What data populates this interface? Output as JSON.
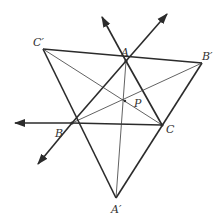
{
  "diagram": {
    "type": "geometry-figure",
    "colors": {
      "stroke": "#2b2b2b",
      "label": "#333333",
      "background": "#ffffff"
    },
    "points": {
      "A": {
        "x": 126,
        "y": 61,
        "label": "A"
      },
      "B": {
        "x": 72,
        "y": 123,
        "label": "B"
      },
      "C": {
        "x": 162,
        "y": 125,
        "label": "C"
      },
      "A_prime": {
        "x": 116,
        "y": 198,
        "label": "A'"
      },
      "B_prime": {
        "x": 202,
        "y": 63,
        "label": "B'"
      },
      "C_prime": {
        "x": 43,
        "y": 49,
        "label": "C'"
      },
      "P": {
        "x": 125,
        "y": 101,
        "label": "P"
      }
    },
    "labels": {
      "A": "A",
      "B": "B",
      "C": "C",
      "A_prime": "A′",
      "B_prime": "B′",
      "C_prime": "C′",
      "P": "P"
    },
    "thick_segments": [
      [
        "C_prime",
        "B_prime"
      ],
      [
        "C_prime",
        "A_prime"
      ],
      [
        "B_prime",
        "A_prime"
      ],
      [
        "A",
        "B"
      ],
      [
        "B",
        "C"
      ],
      [
        "C",
        "A"
      ]
    ],
    "thin_segments": [
      [
        "A",
        "A_prime"
      ],
      [
        "B",
        "B_prime"
      ],
      [
        "C",
        "C_prime"
      ]
    ],
    "rays": [
      {
        "from": "B",
        "to": [
          15,
          123
        ],
        "desc": "ray from C through B extended left"
      },
      {
        "from": "B",
        "to": [
          38,
          164
        ],
        "desc": "ray from A through B extended down-left"
      },
      {
        "from": "A",
        "to": [
          167,
          14
        ],
        "desc": "ray from B through A extended up-right"
      },
      {
        "from": "A",
        "to": [
          102,
          17
        ],
        "desc": "ray from C through A extended up-left"
      }
    ]
  }
}
